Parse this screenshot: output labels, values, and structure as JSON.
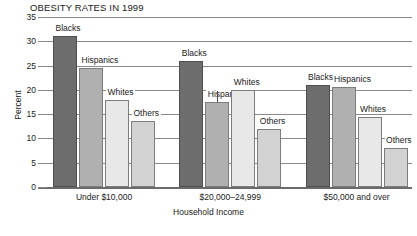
{
  "chart_data": {
    "type": "bar",
    "title": "OBESITY RATES IN 1999",
    "xlabel": "Household Income",
    "ylabel": "Percent",
    "categories": [
      "Under $10,000",
      "$20,000–24,999",
      "$50,000 and over"
    ],
    "series": [
      {
        "name": "Blacks",
        "values": [
          31.0,
          26.0,
          21.0
        ]
      },
      {
        "name": "Hispanics",
        "values": [
          24.5,
          17.5,
          20.5
        ]
      },
      {
        "name": "Whites",
        "values": [
          18.0,
          20.0,
          14.5
        ]
      },
      {
        "name": "Others",
        "values": [
          13.5,
          12.0,
          8.0
        ]
      }
    ],
    "ylim": [
      0,
      35
    ],
    "yticks": [
      0,
      5,
      10,
      15,
      20,
      25,
      30,
      35
    ],
    "ytick_labels": [
      "0",
      "5",
      "10",
      "15",
      "20",
      "25",
      "30",
      "35"
    ],
    "grid": true,
    "legend": "inline-series-labels",
    "series_colors": {
      "Blacks": "#6d6d6d",
      "Hispanics": "#b0b0b0",
      "Whites": "#e8e8e8",
      "Others": "#d2d2d2"
    },
    "annotations": [
      {
        "text": "Blacks",
        "group": 0
      },
      {
        "text": "Hispanics",
        "group": 0
      },
      {
        "text": "Whites",
        "group": 0
      },
      {
        "text": "Others",
        "group": 0
      },
      {
        "text": "Blacks",
        "group": 1
      },
      {
        "text": "Hispanics",
        "group": 1
      },
      {
        "text": "Whites",
        "group": 1
      },
      {
        "text": "Others",
        "group": 1
      },
      {
        "text": "Blacks",
        "group": 2
      },
      {
        "text": "Hispanics",
        "group": 2
      },
      {
        "text": "Whites",
        "group": 2
      },
      {
        "text": "Others",
        "group": 2
      }
    ]
  }
}
